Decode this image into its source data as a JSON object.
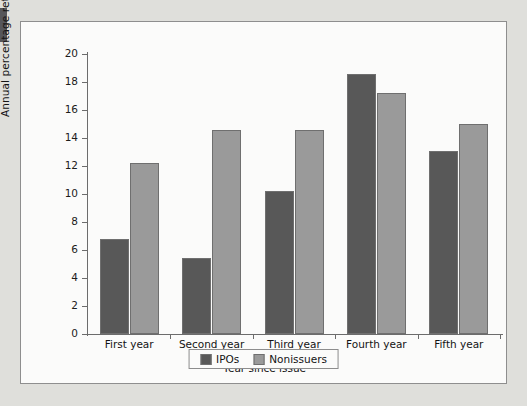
{
  "chart_data": {
    "type": "bar",
    "title": "",
    "xlabel": "Year since issue",
    "ylabel": "Annual percentage return",
    "categories": [
      "First year",
      "Second year",
      "Third year",
      "Fourth year",
      "Fifth year"
    ],
    "series": [
      {
        "name": "IPOs",
        "color": "#585858",
        "values": [
          6.8,
          5.4,
          10.2,
          18.6,
          13.1
        ]
      },
      {
        "name": "Nonissuers",
        "color": "#9a9a9a",
        "values": [
          12.2,
          14.6,
          14.6,
          17.2,
          15.0
        ]
      }
    ],
    "ylim": [
      0,
      20
    ],
    "ytick_step": 2,
    "yticks": [
      20,
      18,
      16,
      14,
      12,
      10,
      8,
      6,
      4,
      2,
      0
    ],
    "ytick_labels": [
      "20",
      "18",
      "16",
      "14",
      "12",
      "10",
      "8",
      "6",
      "4",
      "2",
      "0"
    ],
    "grid": false,
    "legend_position": "bottom-center",
    "legend_entries": [
      "IPOs",
      "Nonissuers"
    ]
  },
  "colors": {
    "page_background": "#dfdfdb",
    "panel_background": "#fbfbfa",
    "panel_border": "#8e8e8e",
    "axis": "#6c6c6c",
    "text": "#141414",
    "edge_marker": "#55565a"
  }
}
